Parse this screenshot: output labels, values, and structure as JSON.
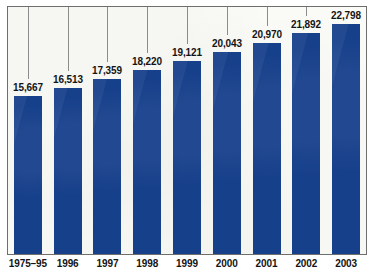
{
  "chart_data": {
    "type": "bar",
    "title": "",
    "subtitle": "",
    "xlabel": "",
    "ylabel": "",
    "grid": false,
    "legend": "none",
    "axis": {
      "y_visible": false,
      "y_tick_labels": [],
      "x_axis_line": true,
      "ylim": [
        0,
        24500
      ]
    },
    "categories": [
      "1975–95",
      "1996",
      "1997",
      "1998",
      "1999",
      "2000",
      "2001",
      "2002",
      "2003"
    ],
    "values": [
      15667,
      16513,
      17359,
      18220,
      19121,
      20043,
      20970,
      21892,
      22798
    ],
    "value_labels": [
      "15,667",
      "16,513",
      "17,359",
      "18,220",
      "19,121",
      "20,043",
      "20,970",
      "21,892",
      "22,798"
    ],
    "series": [
      {
        "name": "",
        "color": "#17408b",
        "values": [
          15667,
          16513,
          17359,
          18220,
          19121,
          20043,
          20970,
          21892,
          22798
        ]
      }
    ],
    "annotations": {
      "leader_lines": true,
      "leader_line_color": "#8c8c8c"
    }
  },
  "style": {
    "bar_color": "#17408b",
    "frame_border_color": "#6e6e6e",
    "plot_background": "#fbfbf8",
    "page_background": "#ffffff",
    "label_color": "#141414"
  }
}
